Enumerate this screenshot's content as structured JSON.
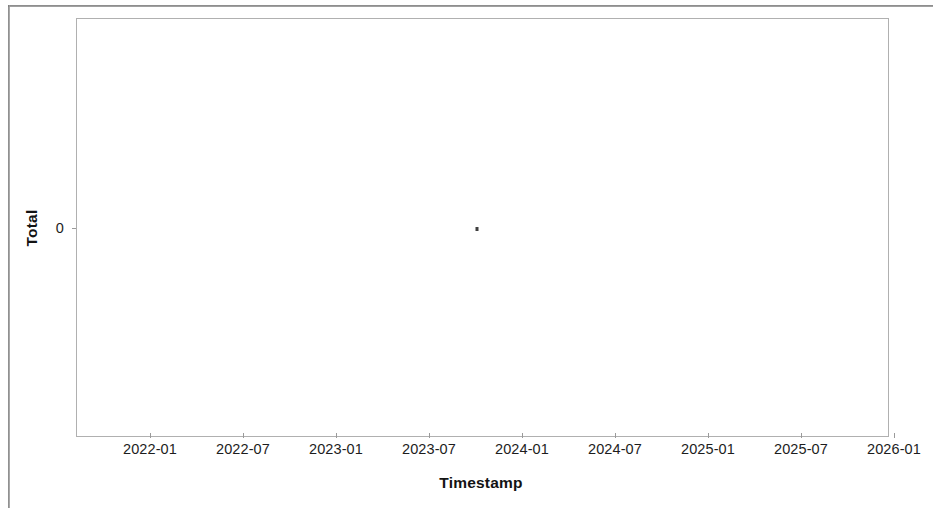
{
  "chart_data": {
    "type": "scatter",
    "title": "",
    "xlabel": "Timestamp",
    "ylabel": "Total",
    "grid": false,
    "legend": false,
    "legend_position": "none",
    "xticklabels": [
      "2022-01",
      "2022-07",
      "2023-01",
      "2023-07",
      "2024-01",
      "2024-07",
      "2025-01",
      "2025-07",
      "2026-01"
    ],
    "yticklabels": [
      "0"
    ],
    "ylim": [
      -1,
      1
    ],
    "xlim": [
      "2021-09",
      "2026-03"
    ],
    "marker_color": "#3f3f3f",
    "series": [
      {
        "name": "Total",
        "points": [
          {
            "x": "2023-10",
            "y": 0
          }
        ],
        "values": [
          0
        ]
      }
    ]
  },
  "figure": {
    "frame_color": "#b0b0b0",
    "background": "#ffffff"
  }
}
